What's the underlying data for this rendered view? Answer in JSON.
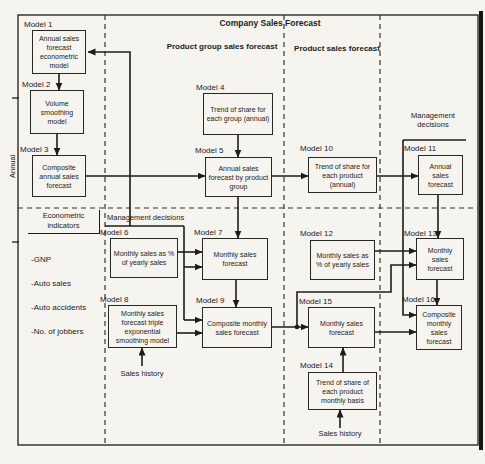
{
  "theme": {
    "paper": "#f6f4ef",
    "ink": "#1d1c1a"
  },
  "title": "Company Sales Forecast",
  "columns": {
    "group_header": "Product group sales forecast",
    "product_header": "Product sales forecast"
  },
  "side_label": "Annual",
  "management_left": "Management decisions",
  "management_right": "Management decisions",
  "econometric": {
    "title": "Econometric indicators",
    "items": [
      "-GNP",
      "-Auto sales",
      "-Auto accidents",
      "-No. of jobbers"
    ]
  },
  "sales_history_left": "Sales history",
  "sales_history_right": "Sales history",
  "models": {
    "m1": {
      "label": "Model 1",
      "text": "Annual sales forecast econometric model"
    },
    "m2": {
      "label": "Model 2",
      "text": "Volume smoothing model"
    },
    "m3": {
      "label": "Model 3",
      "text": "Composite annual sales forecast"
    },
    "m4": {
      "label": "Model 4",
      "text": "Trend of share for each group (annual)"
    },
    "m5": {
      "label": "Model 5",
      "text": "Annual sales forecast by product group"
    },
    "m6": {
      "label": "Model 6",
      "text": "Monthly sales as % of yearly sales"
    },
    "m7": {
      "label": "Model 7",
      "text": "Monthly sales forecast"
    },
    "m8": {
      "label": "Model 8",
      "text": "Monthly sales forecast triple exponential smoothing model"
    },
    "m9": {
      "label": "Model 9",
      "text": "Composite monthly sales forecast"
    },
    "m10": {
      "label": "Model 10",
      "text": "Trend of share for each product (annual)"
    },
    "m11": {
      "label": "Model 11",
      "text": "Annual sales forecast"
    },
    "m12": {
      "label": "Model 12",
      "text": "Monthly sales as % of yearly sales"
    },
    "m13": {
      "label": "Model 13",
      "text": "Monthly sales forecast"
    },
    "m14": {
      "label": "Model 14",
      "text": "Trend of share of each product monthly basis"
    },
    "m15": {
      "label": "Model 15",
      "text": "Monthly sales forecast"
    },
    "m16": {
      "label": "Model 16",
      "text": "Composite monthly sales forecast"
    }
  }
}
